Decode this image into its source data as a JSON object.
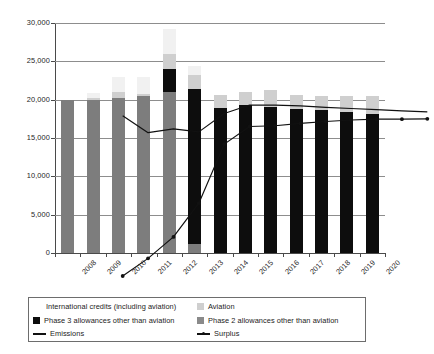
{
  "chart_data": {
    "type": "bar",
    "title": "",
    "subtitle": "",
    "xlabel": "",
    "ylabel": "",
    "ylim": [
      0,
      30000
    ],
    "ytick_values": [
      0,
      5000,
      10000,
      15000,
      20000,
      25000,
      30000
    ],
    "ytick_labels": [
      "0",
      "5,000",
      "10,000",
      "15,000",
      "20,000",
      "25,000",
      "30,000"
    ],
    "grid": true,
    "grid_axis": "y",
    "legend_position": "bottom",
    "stacked": true,
    "categories": [
      "2008",
      "2009",
      "2010",
      "2011",
      "2012",
      "2013",
      "2014",
      "2015",
      "2016",
      "2017",
      "2018",
      "2019",
      "2020"
    ],
    "series": [
      {
        "name": "Phase 2 allowances other than aviation",
        "kind": "bar-segment",
        "color": "#7d7d7d",
        "values": [
          19950,
          19900,
          20250,
          20450,
          21050,
          1200,
          0,
          0,
          0,
          0,
          0,
          0,
          0
        ]
      },
      {
        "name": "Phase 3 allowances other than aviation",
        "kind": "bar-segment",
        "color": "#0d0d0d",
        "values": [
          0,
          0,
          0,
          0,
          2900,
          20200,
          18950,
          19250,
          19100,
          18800,
          18650,
          18350,
          18100
        ]
      },
      {
        "name": "Aviation",
        "kind": "bar-segment",
        "color": "#cfcfcf",
        "values": [
          0,
          350,
          700,
          350,
          2050,
          1800,
          1700,
          1750,
          2100,
          1750,
          1850,
          2100,
          2400
        ]
      },
      {
        "name": "International credits (including aviation)",
        "kind": "bar-segment",
        "color": "#f1f1f1",
        "values": [
          0,
          600,
          1950,
          2100,
          3200,
          1200,
          0,
          0,
          0,
          0,
          0,
          0,
          0
        ]
      },
      {
        "name": "Emissions",
        "kind": "line",
        "color": "#111111",
        "marker": "none",
        "values": [
          20900,
          18700,
          19200,
          18800,
          21200,
          22300,
          22300,
          22200,
          22000,
          21850,
          21700,
          21550,
          21400
        ]
      },
      {
        "name": "Surplus",
        "kind": "line",
        "color": "#111111",
        "marker": "dot",
        "values": [
          0,
          2300,
          5100,
          9500,
          17200,
          19500,
          19600,
          19900,
          20150,
          20350,
          20450,
          20450,
          20500
        ]
      }
    ]
  },
  "legend": {
    "entries": [
      {
        "label": "International credits (including aviation)",
        "swatch": "intl",
        "glyph": "square"
      },
      {
        "label": "Aviation",
        "swatch": "aviation",
        "glyph": "square"
      },
      {
        "label": "Phase 3 allowances other than aviation",
        "swatch": "phase3",
        "glyph": "square"
      },
      {
        "label": "Phase 2 allowances other than aviation",
        "swatch": "phase2",
        "glyph": "square"
      },
      {
        "label": "Emissions",
        "swatch": "line-plain",
        "glyph": "line"
      },
      {
        "label": "Surplus",
        "swatch": "line-dot",
        "glyph": "line-marker"
      }
    ]
  },
  "colors": {
    "phase2": "#7d7d7d",
    "phase3": "#0d0d0d",
    "aviation": "#cfcfcf",
    "international_credits": "#f1f1f1",
    "line": "#111111",
    "gridline": "#8d8d8d",
    "axis": "#4a4a4a",
    "background": "#ffffff"
  }
}
